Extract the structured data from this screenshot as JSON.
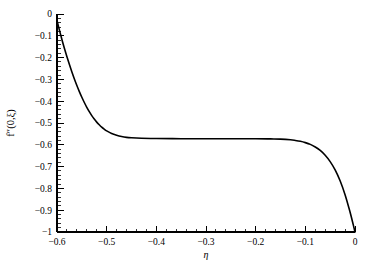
{
  "chart_data": {
    "type": "line",
    "title": "",
    "subtitle": "",
    "xlabel": "η",
    "ylabel": "f″(0,ξ)",
    "xlim": [
      -0.6,
      0.0
    ],
    "ylim": [
      -1.0,
      0.0
    ],
    "grid": false,
    "legend": null,
    "x_ticks": [
      -0.6,
      -0.5,
      -0.4,
      -0.3,
      -0.2,
      -0.1,
      0.0
    ],
    "x_tick_labels": [
      "-0.6",
      "-0.5",
      "-0.4",
      "-0.3",
      "-0.2",
      "-0.1",
      "0"
    ],
    "y_ticks": [
      0.0,
      -0.1,
      -0.2,
      -0.3,
      -0.4,
      -0.5,
      -0.6,
      -0.7,
      -0.8,
      -0.9,
      -1.0
    ],
    "y_tick_labels": [
      "0",
      "-0.1",
      "-0.2",
      "-0.3",
      "-0.4",
      "-0.5",
      "-0.6",
      "-0.7",
      "-0.8",
      "-0.9",
      "-1"
    ],
    "x_minor_tick_step": 0.02,
    "y_minor_tick_step": 0.02,
    "series": [
      {
        "name": "f''(0,ξ)",
        "color": "#000000",
        "x": [
          -0.6,
          -0.595,
          -0.59,
          -0.585,
          -0.58,
          -0.575,
          -0.57,
          -0.565,
          -0.56,
          -0.555,
          -0.55,
          -0.545,
          -0.54,
          -0.535,
          -0.53,
          -0.525,
          -0.52,
          -0.515,
          -0.51,
          -0.505,
          -0.5,
          -0.49,
          -0.48,
          -0.47,
          -0.46,
          -0.45,
          -0.43,
          -0.4,
          -0.35,
          -0.3,
          -0.25,
          -0.2,
          -0.17,
          -0.15,
          -0.13,
          -0.12,
          -0.11,
          -0.1,
          -0.09,
          -0.08,
          -0.07,
          -0.06,
          -0.05,
          -0.04,
          -0.03,
          -0.02,
          -0.01,
          -0.005,
          0.0
        ],
        "values": [
          -0.03,
          -0.075,
          -0.118,
          -0.158,
          -0.196,
          -0.232,
          -0.266,
          -0.298,
          -0.328,
          -0.356,
          -0.382,
          -0.406,
          -0.428,
          -0.448,
          -0.466,
          -0.482,
          -0.496,
          -0.508,
          -0.519,
          -0.528,
          -0.536,
          -0.548,
          -0.556,
          -0.562,
          -0.566,
          -0.568,
          -0.57,
          -0.571,
          -0.572,
          -0.572,
          -0.572,
          -0.572,
          -0.573,
          -0.574,
          -0.577,
          -0.58,
          -0.584,
          -0.59,
          -0.598,
          -0.61,
          -0.626,
          -0.648,
          -0.677,
          -0.715,
          -0.765,
          -0.829,
          -0.908,
          -0.953,
          -1.0
        ]
      }
    ]
  },
  "plot_geometry": {
    "left": 57,
    "right": 355,
    "top": 14,
    "bottom": 232
  }
}
